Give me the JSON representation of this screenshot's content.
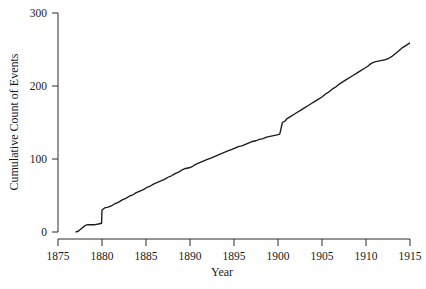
{
  "chart_data": {
    "type": "line",
    "title": "",
    "subtitle": "",
    "xlabel": "Year",
    "ylabel": "Cumulative Count of Events",
    "xlim": [
      1875,
      1915
    ],
    "ylim": [
      0,
      300
    ],
    "xticks": [
      1875,
      1880,
      1885,
      1890,
      1895,
      1900,
      1905,
      1910,
      1915
    ],
    "yticks": [
      0,
      100,
      200,
      300
    ],
    "xtick_labels": [
      "1875",
      "1880",
      "1885",
      "1890",
      "1895",
      "1900",
      "1905",
      "1910",
      "1915"
    ],
    "ytick_labels": [
      "0",
      "100",
      "200",
      "300"
    ],
    "grid": false,
    "legend": false,
    "legend_position": "none",
    "line_color": "#1a1a1a",
    "background_color": "#ffffff",
    "step_shape": "staircase-monotonic-increasing",
    "annotations": [],
    "series": [
      {
        "name": "Cumulative Count of Events",
        "x": [
          1877.0,
          1877.3,
          1877.6,
          1877.9,
          1878.1,
          1878.4,
          1878.8,
          1879.2,
          1879.6,
          1879.95,
          1880.0,
          1880.3,
          1880.7,
          1881.1,
          1881.5,
          1881.9,
          1882.3,
          1882.7,
          1883.1,
          1883.5,
          1883.9,
          1884.3,
          1884.7,
          1885.1,
          1885.5,
          1885.9,
          1886.3,
          1886.7,
          1887.1,
          1887.5,
          1887.9,
          1888.3,
          1888.7,
          1889.1,
          1889.5,
          1889.9,
          1890.3,
          1890.7,
          1891.1,
          1891.5,
          1891.9,
          1892.3,
          1892.7,
          1893.1,
          1893.5,
          1893.9,
          1894.3,
          1894.7,
          1895.1,
          1895.5,
          1895.9,
          1896.3,
          1896.7,
          1897.1,
          1897.5,
          1897.9,
          1898.3,
          1898.7,
          1899.1,
          1899.5,
          1899.9,
          1900.2,
          1900.5,
          1900.8,
          1901.0,
          1901.4,
          1901.8,
          1902.2,
          1902.6,
          1903.0,
          1903.4,
          1903.8,
          1904.2,
          1904.6,
          1905.0,
          1905.4,
          1905.8,
          1906.2,
          1906.6,
          1907.0,
          1907.4,
          1907.8,
          1908.2,
          1908.6,
          1909.0,
          1909.4,
          1909.8,
          1910.2,
          1910.6,
          1911.0,
          1911.4,
          1911.8,
          1912.2,
          1912.6,
          1913.0,
          1913.4,
          1913.8,
          1914.2,
          1914.6,
          1915.0
        ],
        "y": [
          0,
          1,
          4,
          7,
          9,
          10,
          10,
          10,
          11,
          12,
          30,
          33,
          34,
          36,
          39,
          41,
          44,
          46,
          49,
          51,
          54,
          56,
          58,
          61,
          63,
          66,
          68,
          70,
          72,
          75,
          77,
          80,
          82,
          85,
          87,
          88,
          90,
          93,
          95,
          97,
          99,
          101,
          103,
          105,
          107,
          109,
          111,
          113,
          115,
          117,
          118,
          120,
          122,
          124,
          125,
          127,
          128,
          130,
          131,
          132,
          133,
          134,
          150,
          152,
          155,
          158,
          161,
          164,
          167,
          170,
          173,
          176,
          179,
          182,
          185,
          189,
          192,
          196,
          199,
          203,
          206,
          209,
          212,
          215,
          218,
          221,
          224,
          227,
          231,
          233,
          234,
          235,
          236,
          238,
          241,
          245,
          249,
          253,
          256,
          259
        ]
      }
    ]
  },
  "figure": {
    "plot_area": {
      "left_px": 58,
      "right_px": 410,
      "top_px": 13,
      "bottom_px": 232
    }
  }
}
